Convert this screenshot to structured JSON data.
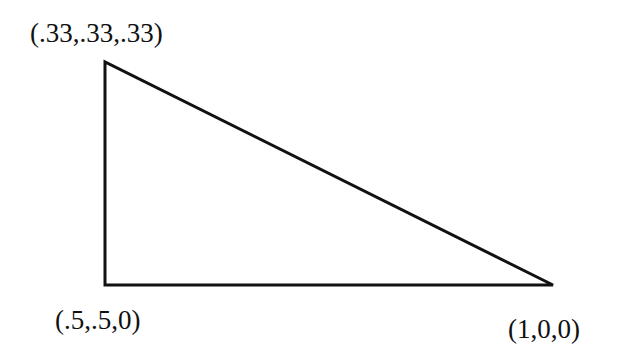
{
  "diagram": {
    "type": "triangle",
    "stroke_color": "#111111",
    "background": "#ffffff",
    "vertices": [
      {
        "id": "top-left",
        "label": "(.33,.33,.33)",
        "coords": [
          0.33,
          0.33,
          0.33
        ]
      },
      {
        "id": "bottom-left",
        "label": "(.5,.5,0)",
        "coords": [
          0.5,
          0.5,
          0
        ]
      },
      {
        "id": "bottom-right",
        "label": "(1,0,0)",
        "coords": [
          1,
          0,
          0
        ]
      }
    ]
  }
}
